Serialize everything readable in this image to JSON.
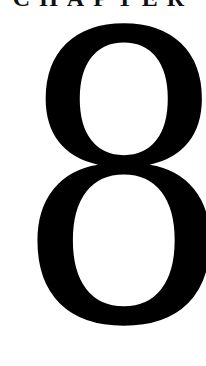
{
  "chapter": {
    "label": "CHAPTER",
    "number": "8"
  },
  "colors": {
    "background": "#ffffff",
    "text": "#000000"
  }
}
